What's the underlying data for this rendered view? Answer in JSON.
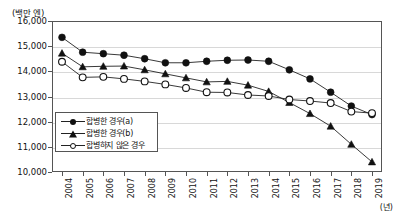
{
  "chart_data": {
    "type": "line",
    "title": "",
    "ylabel": "(백만 엔)",
    "xlabel": "(년)",
    "ylim": [
      10000,
      16000
    ],
    "yticks": [
      10000,
      11000,
      12000,
      13000,
      14000,
      15000,
      16000
    ],
    "ytick_labels": [
      "10,000",
      "11,000",
      "12,000",
      "13,000",
      "14,000",
      "15,000",
      "16,000"
    ],
    "grid": true,
    "legend_position": "lower-left",
    "categories": [
      2004,
      2005,
      2006,
      2007,
      2008,
      2009,
      2010,
      2011,
      2012,
      2013,
      2014,
      2015,
      2016,
      2017,
      2018,
      2019
    ],
    "xtick_labels": [
      "2004",
      "2005",
      "2006",
      "2007",
      "2008",
      "2009",
      "2010",
      "2011",
      "2012",
      "2013",
      "2014",
      "2015",
      "2016",
      "2017",
      "2018",
      "2019"
    ],
    "series": [
      {
        "name": "합병한 경우(a)",
        "marker": "filled-circle",
        "values": [
          15350,
          14760,
          14700,
          14640,
          14500,
          14340,
          14340,
          14400,
          14440,
          14450,
          14400,
          14060,
          13700,
          13170,
          12620,
          12280
        ]
      },
      {
        "name": "합병한 경우(b)",
        "marker": "filled-triangle",
        "values": [
          14720,
          14180,
          14200,
          14210,
          14060,
          13900,
          13740,
          13580,
          13600,
          13450,
          13200,
          12760,
          12320,
          11820,
          11100,
          10400
        ]
      },
      {
        "name": "합병하지 않은 경우",
        "marker": "open-circle",
        "values": [
          14380,
          13760,
          13780,
          13700,
          13600,
          13480,
          13340,
          13170,
          13160,
          13060,
          13020,
          12880,
          12820,
          12740,
          12400,
          12340
        ]
      }
    ]
  },
  "legend": {
    "items": [
      {
        "label": "합병한 경우(a)",
        "marker": "filled-circle"
      },
      {
        "label": "합병한 경우(b)",
        "marker": "filled-triangle"
      },
      {
        "label": "합병하지 않은 경우",
        "marker": "open-circle"
      }
    ]
  },
  "axis": {
    "y_unit": "(백만 엔)",
    "x_unit": "(년)"
  }
}
